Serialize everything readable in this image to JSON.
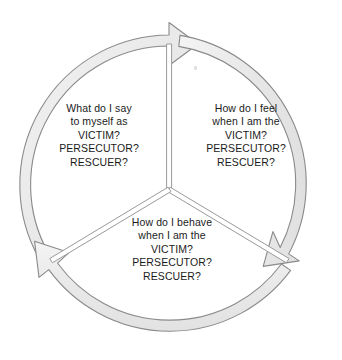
{
  "diagram": {
    "type": "cyclic-three-segment",
    "title": "",
    "direction": "clockwise",
    "colors": {
      "band_fill": "#ebebeb",
      "band_fill_light": "#f7f7f7",
      "band_stroke": "#8a8a8a",
      "divider_stroke": "#9a9a9a",
      "text": "#1b1b1b",
      "background": "#ffffff"
    },
    "geometry": {
      "center_x": 169,
      "center_y": 185,
      "outer_radius": 150,
      "inner_radius": 139,
      "divider_inner_radius": 0,
      "segment_count": 3
    },
    "segments": [
      {
        "id": "say",
        "position": "left",
        "arrow_label": "arrow-to-feel",
        "lines": [
          "What do I say",
          "to myself as",
          "VICTIM?",
          "PERSECUTOR?",
          "RESCUER?"
        ]
      },
      {
        "id": "feel",
        "position": "right",
        "arrow_label": "arrow-to-behave",
        "lines": [
          "How do I feel",
          "when I am the",
          "VICTIM?",
          "PERSECUTOR?",
          "RESCUER?"
        ]
      },
      {
        "id": "behave",
        "position": "bottom",
        "arrow_label": "arrow-to-say",
        "lines": [
          "How do I behave",
          "when I am the",
          "VICTIM?",
          "PERSECUTOR?",
          "RESCUER?"
        ]
      }
    ],
    "arrows": [
      {
        "id": "arrow-top",
        "points_to": "feel-segment",
        "tip_angle_deg": 0
      },
      {
        "id": "arrow-lower-right",
        "points_to": "behave-segment",
        "tip_angle_deg": 120
      },
      {
        "id": "arrow-lower-left",
        "points_to": "say-segment",
        "tip_angle_deg": 240
      }
    ]
  }
}
